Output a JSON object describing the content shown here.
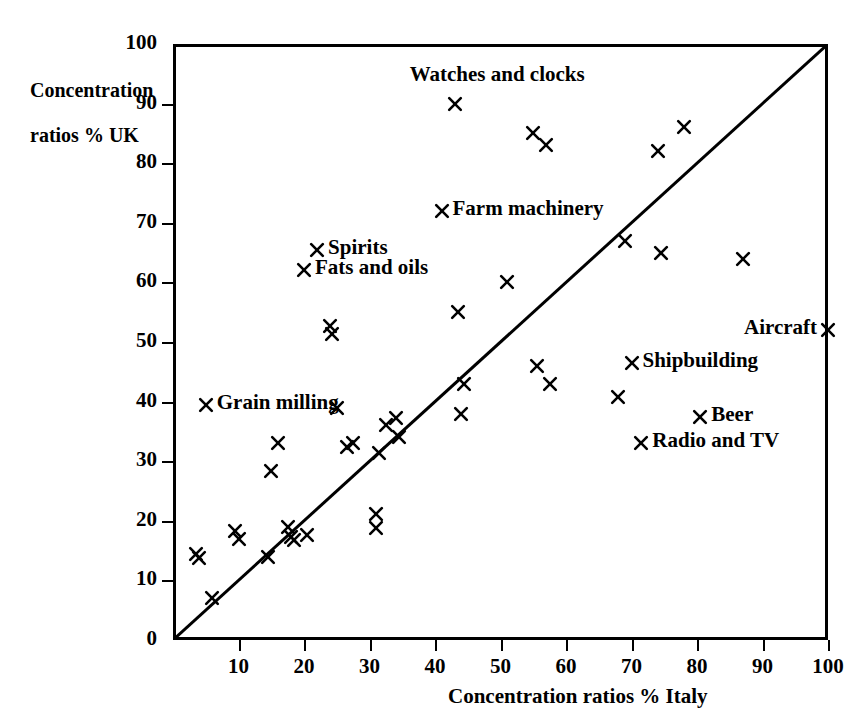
{
  "chart_data": {
    "type": "scatter",
    "title": "",
    "xlabel": "Concentration ratios % Italy",
    "ylabel": "Concentration\nratios % UK",
    "xlim": [
      0,
      100
    ],
    "ylim": [
      0,
      100
    ],
    "xticks": [
      0,
      10,
      20,
      30,
      40,
      50,
      60,
      70,
      80,
      90,
      100
    ],
    "yticks": [
      0,
      10,
      20,
      30,
      40,
      50,
      60,
      70,
      80,
      90,
      100
    ],
    "grid": false,
    "legend": "none",
    "reference_line": {
      "description": "45-degree diagonal line y = x",
      "from": [
        0,
        0
      ],
      "to": [
        100,
        100
      ]
    },
    "marker": "x-cross",
    "points": [
      {
        "x": 3.5,
        "y": 14.5,
        "label": ""
      },
      {
        "x": 4.0,
        "y": 13.8,
        "label": ""
      },
      {
        "x": 5.0,
        "y": 39.5,
        "label": "Grain milling"
      },
      {
        "x": 6.0,
        "y": 7.0,
        "label": ""
      },
      {
        "x": 9.5,
        "y": 18.3,
        "label": ""
      },
      {
        "x": 10.0,
        "y": 17.0,
        "label": ""
      },
      {
        "x": 14.5,
        "y": 14.0,
        "label": ""
      },
      {
        "x": 15.0,
        "y": 28.3,
        "label": ""
      },
      {
        "x": 16.0,
        "y": 33.0,
        "label": ""
      },
      {
        "x": 17.5,
        "y": 19.0,
        "label": ""
      },
      {
        "x": 18.0,
        "y": 17.3,
        "label": ""
      },
      {
        "x": 18.5,
        "y": 16.7,
        "label": ""
      },
      {
        "x": 20.5,
        "y": 17.6,
        "label": ""
      },
      {
        "x": 22.0,
        "y": 65.5,
        "label": "Spirits"
      },
      {
        "x": 20.0,
        "y": 62.0,
        "label": "Fats and oils"
      },
      {
        "x": 24.0,
        "y": 52.7,
        "label": ""
      },
      {
        "x": 24.2,
        "y": 51.3,
        "label": ""
      },
      {
        "x": 25.0,
        "y": 39.0,
        "label": ""
      },
      {
        "x": 26.5,
        "y": 32.3,
        "label": ""
      },
      {
        "x": 27.5,
        "y": 33.0,
        "label": ""
      },
      {
        "x": 31.0,
        "y": 21.2,
        "label": ""
      },
      {
        "x": 31.0,
        "y": 18.8,
        "label": ""
      },
      {
        "x": 31.5,
        "y": 31.3,
        "label": ""
      },
      {
        "x": 32.5,
        "y": 36.0,
        "label": ""
      },
      {
        "x": 34.0,
        "y": 37.2,
        "label": ""
      },
      {
        "x": 34.5,
        "y": 34.0,
        "label": ""
      },
      {
        "x": 41.0,
        "y": 72.0,
        "label": "Farm machinery"
      },
      {
        "x": 43.0,
        "y": 90.0,
        "label": "Watches and clocks"
      },
      {
        "x": 43.5,
        "y": 55.0,
        "label": ""
      },
      {
        "x": 44.0,
        "y": 38.0,
        "label": ""
      },
      {
        "x": 44.5,
        "y": 43.0,
        "label": ""
      },
      {
        "x": 51.0,
        "y": 60.0,
        "label": ""
      },
      {
        "x": 55.0,
        "y": 85.0,
        "label": ""
      },
      {
        "x": 55.5,
        "y": 46.0,
        "label": ""
      },
      {
        "x": 57.0,
        "y": 83.0,
        "label": ""
      },
      {
        "x": 57.5,
        "y": 43.0,
        "label": ""
      },
      {
        "x": 68.0,
        "y": 40.7,
        "label": ""
      },
      {
        "x": 69.0,
        "y": 67.0,
        "label": ""
      },
      {
        "x": 70.0,
        "y": 46.5,
        "label": "Shipbuilding"
      },
      {
        "x": 71.5,
        "y": 33.0,
        "label": "Radio and TV"
      },
      {
        "x": 74.0,
        "y": 82.0,
        "label": ""
      },
      {
        "x": 74.5,
        "y": 65.0,
        "label": ""
      },
      {
        "x": 78.0,
        "y": 86.0,
        "label": ""
      },
      {
        "x": 80.5,
        "y": 37.5,
        "label": "Beer"
      },
      {
        "x": 87.0,
        "y": 64.0,
        "label": ""
      },
      {
        "x": 100.0,
        "y": 52.0,
        "label": "Aircraft"
      }
    ],
    "annotations": [
      {
        "text": "Watches and clocks",
        "x": 43.0,
        "y": 90.0,
        "placement": "above"
      },
      {
        "text": "Farm machinery",
        "x": 41.0,
        "y": 72.0,
        "placement": "right"
      },
      {
        "text": "Spirits",
        "x": 22.0,
        "y": 65.5,
        "placement": "right"
      },
      {
        "text": "Fats and oils",
        "x": 20.0,
        "y": 62.0,
        "placement": "right"
      },
      {
        "text": "Grain milling",
        "x": 5.0,
        "y": 39.5,
        "placement": "right"
      },
      {
        "text": "Aircraft",
        "x": 100.0,
        "y": 52.0,
        "placement": "left"
      },
      {
        "text": "Shipbuilding",
        "x": 70.0,
        "y": 46.5,
        "placement": "right"
      },
      {
        "text": "Beer",
        "x": 80.5,
        "y": 37.5,
        "placement": "right"
      },
      {
        "text": "Radio and TV",
        "x": 71.5,
        "y": 33.0,
        "placement": "right"
      }
    ]
  },
  "axes": {
    "y_title_line1": "Concentration",
    "y_title_line2": "ratios % UK",
    "x_title": "Concentration ratios % Italy"
  },
  "tick_labels": {
    "y": [
      "0",
      "10",
      "20",
      "30",
      "40",
      "50",
      "60",
      "70",
      "80",
      "90",
      "100"
    ],
    "x": [
      "10",
      "20",
      "30",
      "40",
      "50",
      "60",
      "70",
      "80",
      "90",
      "100"
    ]
  },
  "colors": {
    "ink": "#000000",
    "paper": "#ffffff"
  }
}
